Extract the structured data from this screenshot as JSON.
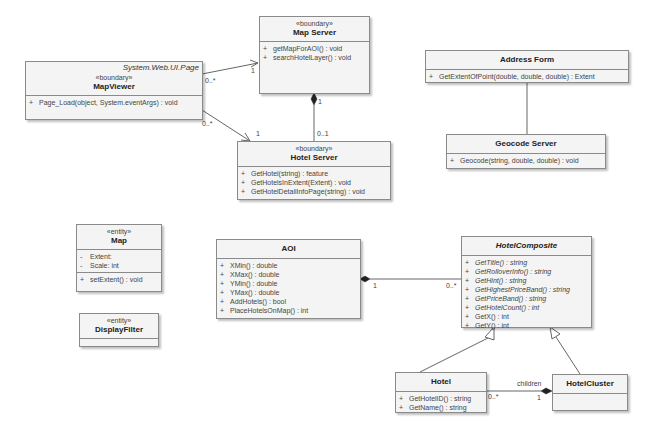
{
  "classes": {
    "map_viewer": {
      "parent": "System.Web.UI.Page",
      "stereotype": "«boundary»",
      "name": "MapViewer",
      "operations": [
        {
          "vis": "+",
          "text": "Page_Load(object, System.eventArgs) : void"
        }
      ]
    },
    "map_server": {
      "stereotype": "«boundary»",
      "name": "Map Server",
      "operations": [
        {
          "vis": "+",
          "text": "getMapForAOI() : void"
        },
        {
          "vis": "+",
          "text": "searchHotelLayer() : void"
        }
      ]
    },
    "hotel_server": {
      "stereotype": "«boundary»",
      "name": "Hotel Server",
      "operations": [
        {
          "vis": "+",
          "text": "GetHotel(string) : feature"
        },
        {
          "vis": "+",
          "text": "GetHotelsInExtent(Extent) : void"
        },
        {
          "vis": "+",
          "text": "GetHotelDetailInfoPage(string) : void"
        }
      ]
    },
    "address_form": {
      "name": "Address Form",
      "operations": [
        {
          "vis": "+",
          "text": "GetExtentOfPoint(double, double, double) : Extent"
        }
      ]
    },
    "geocode_server": {
      "name": "Geocode Server",
      "operations": [
        {
          "vis": "+",
          "text": "Geocode(string, double, double) : void"
        }
      ]
    },
    "map": {
      "stereotype": "«entity»",
      "name": "Map",
      "attributes": [
        {
          "vis": "-",
          "text": "Extent:"
        },
        {
          "vis": "-",
          "text": "Scale:  int"
        }
      ],
      "operations": [
        {
          "vis": "+",
          "text": "setExtent() : void"
        }
      ]
    },
    "display_filter": {
      "stereotype": "«entity»",
      "name": "DisplayFilter"
    },
    "aoi": {
      "name": "AOI",
      "operations": [
        {
          "vis": "+",
          "text": "XMin() : double"
        },
        {
          "vis": "+",
          "text": "XMax() : double"
        },
        {
          "vis": "+",
          "text": "YMin() : double"
        },
        {
          "vis": "+",
          "text": "YMax() : double"
        },
        {
          "vis": "+",
          "text": "AddHotels() : bool"
        },
        {
          "vis": "+",
          "text": "PlaceHotelsOnMap() : int"
        }
      ]
    },
    "hotel_composite": {
      "name": "HotelComposite",
      "operations": [
        {
          "vis": "+",
          "text": "GetTitle() : string"
        },
        {
          "vis": "+",
          "text": "GetRolloverInfo() : string"
        },
        {
          "vis": "+",
          "text": "GetHint() : string"
        },
        {
          "vis": "+",
          "text": "GetHighestPriceBand() : string"
        },
        {
          "vis": "+",
          "text": "GetPriceBand() : string"
        },
        {
          "vis": "+",
          "text": "GetHotelCount() : int"
        },
        {
          "vis": "+",
          "text": "GetX() : int"
        },
        {
          "vis": "+",
          "text": "GetY() : int"
        }
      ]
    },
    "hotel": {
      "name": "Hotel",
      "operations": [
        {
          "vis": "+",
          "text": "GetHotelID() : string"
        },
        {
          "vis": "+",
          "text": "GetName() : string"
        }
      ]
    },
    "hotel_cluster": {
      "name": "HotelCluster"
    }
  },
  "relationships": {
    "mapviewer_mapserver": {
      "source_mult": "0..*",
      "target_mult": "1"
    },
    "mapviewer_hotelserver": {
      "source_mult": "0..*",
      "target_mult": "1"
    },
    "mapserver_hotelserver": {
      "source_mult": "1",
      "target_mult": "0..1"
    },
    "aoi_hotelcomposite": {
      "source_mult": "1",
      "target_mult": "0..*"
    },
    "hotel_hotelcluster": {
      "role": "children",
      "source_mult": "0..*",
      "target_mult": "1"
    }
  },
  "colors": {
    "box_fill": "#f4f4f4",
    "border": "#8a8a8a",
    "line": "#666666"
  }
}
